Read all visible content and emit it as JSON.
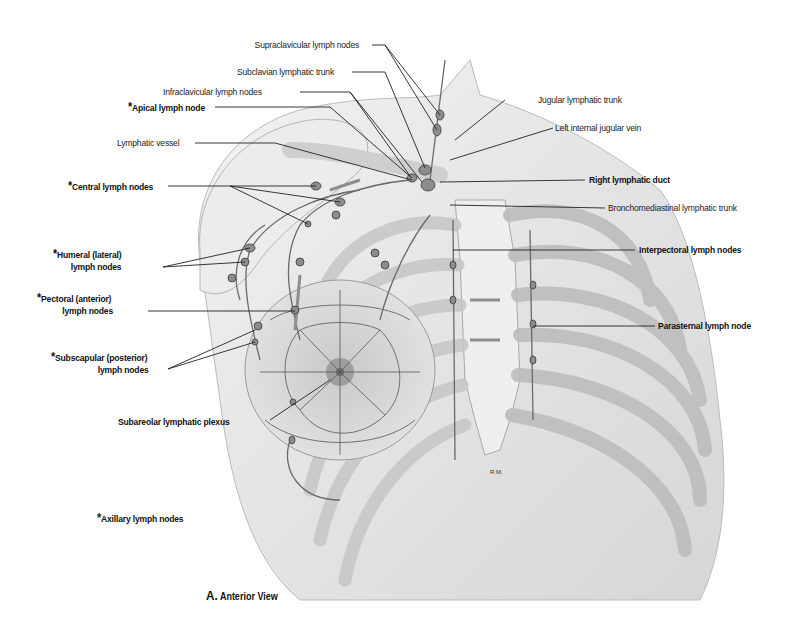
{
  "figure": {
    "caption_letter": "A.",
    "caption_text": "Anterior View",
    "artist_initials": "R.M."
  },
  "labels": {
    "supraclavicular": "Supraclavicular lymph nodes",
    "subclavian_trunk": "Subclavian lymphatic trunk",
    "infraclavicular": "Infraclavicular lymph nodes",
    "apical": "Apical lymph node",
    "lymphatic_vessel": "Lymphatic vessel",
    "central": "Central lymph nodes",
    "humeral_line1": "Humeral (lateral)",
    "humeral_line2": "lymph nodes",
    "pectoral_line1": "Pectoral (anterior)",
    "pectoral_line2": "lymph nodes",
    "subscapular_line1": "Subscapular (posterior)",
    "subscapular_line2": "lymph nodes",
    "subareolar": "Subareolar lymphatic plexus",
    "axillary_legend": "Axillary lymph nodes",
    "jugular_trunk": "Jugular lymphatic trunk",
    "left_ijv": "Left internal jugular vein",
    "right_duct": "Right lymphatic duct",
    "bronchomediastinal": "Bronchomediastinal lymphatic trunk",
    "interpectoral": "Interpectoral lymph nodes",
    "parasternal": "Parasternal lymph node",
    "asterisk": "*"
  },
  "colors": {
    "skin": "#e4e4e4",
    "bone": "#d2d2d2",
    "vessel": "#7a7a7a",
    "node": "#8c8c8c",
    "leader": "#222222"
  }
}
